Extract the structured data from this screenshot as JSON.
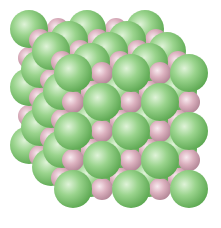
{
  "image": {
    "subject": "Sodium chloride crystal lattice (rock-salt structure)",
    "width": 221,
    "height": 228,
    "background": "#ffffff"
  },
  "lattice": {
    "size": [
      5,
      5,
      5
    ],
    "spacing": 29,
    "origin_front": [
      73,
      73
    ],
    "depth_offset": [
      -11,
      -11
    ],
    "large_ion": {
      "label": "Cl-",
      "color": "#7dc870",
      "highlight": "#d8f0d0",
      "shadow": "#55a24a",
      "radius": 19
    },
    "small_ion": {
      "label": "Na+",
      "color": "#d8aab8",
      "highlight": "#f5e4ea",
      "shadow": "#b58596",
      "radius": 11
    }
  }
}
